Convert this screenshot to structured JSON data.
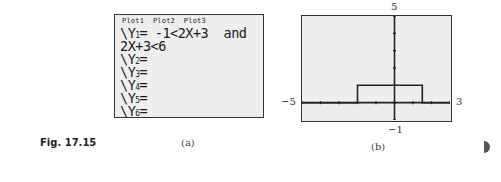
{
  "figure": {
    "label": "Fig. 17.15",
    "panel_a": {
      "caption": "(a)",
      "plot_header": "Plot1  Plot2  Plot3",
      "lines": [
        {
          "prefix": "\\Y",
          "sub": "1",
          "text": "= -1<2X+3  and"
        },
        {
          "prefix": "",
          "sub": "",
          "text": "2X+3<6"
        },
        {
          "prefix": "\\Y",
          "sub": "2",
          "text": "="
        },
        {
          "prefix": "\\Y",
          "sub": "3",
          "text": "="
        },
        {
          "prefix": "\\Y",
          "sub": "4",
          "text": "="
        },
        {
          "prefix": "\\Y",
          "sub": "5",
          "text": "="
        },
        {
          "prefix": "\\Y",
          "sub": "6",
          "text": "="
        }
      ]
    },
    "panel_b": {
      "caption": "(b)",
      "ymax_label": "5",
      "ymin_label": "−1",
      "xmin_label": "−5",
      "xmax_label": "3"
    }
  },
  "chart_data": {
    "type": "line",
    "title": "",
    "xlabel": "",
    "ylabel": "",
    "xlim": [
      -5,
      3
    ],
    "ylim": [
      -1,
      5
    ],
    "grid": false,
    "x_ticks": [
      -5,
      -4,
      -3,
      -2,
      -1,
      0,
      1,
      2,
      3
    ],
    "y_ticks": [
      -1,
      0,
      1,
      2,
      3,
      4,
      5
    ],
    "series": [
      {
        "name": "Y1 = (-1<2X+3 and 2X+3<6)",
        "x": [
          -5,
          -2,
          -2,
          1.5,
          1.5,
          3
        ],
        "y": [
          0,
          0,
          1,
          1,
          0,
          0
        ]
      }
    ]
  }
}
